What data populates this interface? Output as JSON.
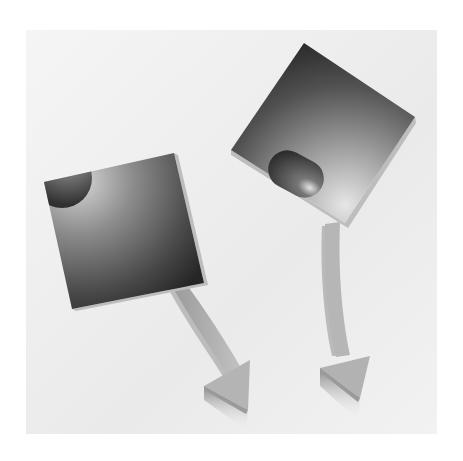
{
  "scene": {
    "description": "Two tilted dark gradient squares with curved arrows pointing downward",
    "colors": {
      "page": "#ffffff",
      "panel_light": "#f4f4f4",
      "panel_dark": "#e2e2e2",
      "square_dark": "#2e2e2e",
      "square_light": "#c8c8c8",
      "square_edge": "#b9b9b9",
      "arrow": "#b3b3b3",
      "arrow_shadow": "#8a8a8a",
      "blob_dark": "#3a3a3a",
      "blob_highlight": "#d8d8d8"
    },
    "objects": [
      {
        "name": "left-square",
        "shape": "square-with-quarter-circle",
        "arrow": "curved-arrow-down-right"
      },
      {
        "name": "right-square",
        "shape": "square-with-oval",
        "arrow": "curved-arrow-down"
      }
    ]
  }
}
